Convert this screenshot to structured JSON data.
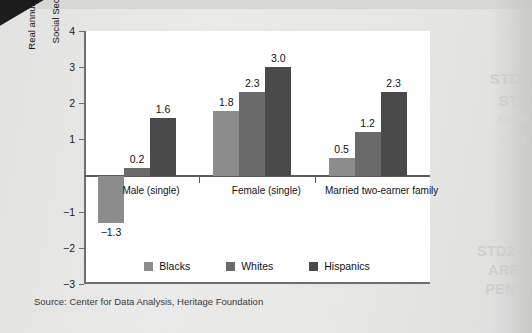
{
  "page": {
    "background_color": "#e8e8e6",
    "card_color": "#ffffff"
  },
  "source_note": "Source: Center for Data Analysis, Heritage Foundation",
  "bleed_through_text": [
    "STD2",
    "STD",
    "ABBRE",
    "PENSI",
    "STD2-S",
    "ARRE",
    "PENSI"
  ],
  "chart_data": {
    "type": "bar",
    "title": "",
    "subtitle": "",
    "xlabel": "",
    "ylabel": "Real annual projected rate of return on\nSocial Security contributions (%)",
    "ylim": [
      -3,
      4
    ],
    "yticks": [
      4,
      3,
      2,
      1,
      -1,
      -2,
      -3
    ],
    "ytick_labels": [
      "4",
      "3",
      "2",
      "1",
      "−1",
      "−2",
      "−3"
    ],
    "grid": false,
    "legend_position": "bottom-center",
    "zero_line": 0,
    "categories": [
      "Male (single)",
      "Female (single)",
      "Married two-earner family"
    ],
    "series": [
      {
        "name": "Blacks",
        "color": "#8c8c8c",
        "values": [
          -1.3,
          1.8,
          0.5
        ],
        "labels": [
          "−1.3",
          "1.8",
          "0.5"
        ]
      },
      {
        "name": "Whites",
        "color": "#6a6a6a",
        "values": [
          0.2,
          2.3,
          1.2
        ],
        "labels": [
          "0.2",
          "2.3",
          "1.2"
        ]
      },
      {
        "name": "Hispanics",
        "color": "#4a4a4a",
        "values": [
          1.6,
          3.0,
          2.3
        ],
        "labels": [
          "1.6",
          "3.0",
          "2.3"
        ]
      }
    ],
    "legend": [
      {
        "label": "Blacks",
        "color": "#8c8c8c"
      },
      {
        "label": "Whites",
        "color": "#6a6a6a"
      },
      {
        "label": "Hispanics",
        "color": "#4a4a4a"
      }
    ]
  }
}
